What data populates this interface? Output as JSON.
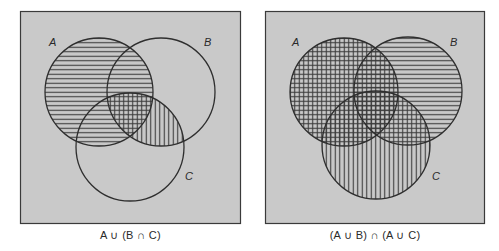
{
  "figure": {
    "colors": {
      "panel_background": "#c9c9c9",
      "panel_border": "#3a3a3a",
      "circle_stroke": "#2e2e2e",
      "hatch_line": "#3a3a3a",
      "page_background": "#ffffff"
    },
    "hatch_spacing_px": 4.5
  },
  "panels": [
    {
      "id": "left",
      "caption": "A ∪ (B ∩ C)",
      "expression": "A ∪ (B ∩ C)",
      "labels": {
        "A": "A",
        "B": "B",
        "C": "C"
      },
      "shading": {
        "horizontal_lines": "A",
        "vertical_lines": "B ∩ C",
        "cross_hatched": "A ∩ B ∩ C"
      }
    },
    {
      "id": "right",
      "caption": "(A ∪ B) ∩ (A ∪ C)",
      "expression": "(A ∪ B) ∩ (A ∪ C)",
      "labels": {
        "A": "A",
        "B": "B",
        "C": "C"
      },
      "shading": {
        "horizontal_lines": "A ∪ B",
        "vertical_lines": "A ∪ C",
        "cross_hatched": "(A ∪ B) ∩ (A ∪ C)"
      }
    }
  ]
}
